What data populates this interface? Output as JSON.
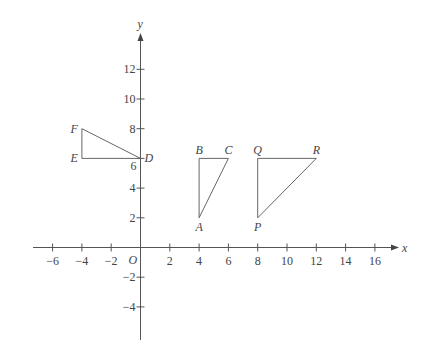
{
  "diagram": {
    "title": "",
    "axes": {
      "x_label": "x",
      "y_label": "y",
      "origin_label": "O",
      "x_range": [
        -7,
        17
      ],
      "y_range": [
        -6.5,
        14
      ],
      "x_ticks": [
        -6,
        -4,
        -2,
        2,
        4,
        6,
        8,
        10,
        12,
        14,
        16
      ],
      "y_ticks": [
        -4,
        -2,
        2,
        4,
        6,
        8,
        10,
        12
      ]
    },
    "shapes": [
      {
        "name": "triangle-DEF",
        "vertices": [
          {
            "label": "D",
            "x": 0,
            "y": 6,
            "label_pos": "right"
          },
          {
            "label": "E",
            "x": -4,
            "y": 6,
            "label_pos": "left"
          },
          {
            "label": "F",
            "x": -4,
            "y": 8,
            "label_pos": "left"
          }
        ]
      },
      {
        "name": "triangle-ABC",
        "vertices": [
          {
            "label": "A",
            "x": 4,
            "y": 2,
            "label_pos": "below"
          },
          {
            "label": "B",
            "x": 4,
            "y": 6,
            "label_pos": "above"
          },
          {
            "label": "C",
            "x": 6,
            "y": 6,
            "label_pos": "above"
          }
        ]
      },
      {
        "name": "triangle-PQR",
        "vertices": [
          {
            "label": "P",
            "x": 8,
            "y": 2,
            "label_pos": "below"
          },
          {
            "label": "Q",
            "x": 8,
            "y": 6,
            "label_pos": "above"
          },
          {
            "label": "R",
            "x": 12,
            "y": 6,
            "label_pos": "above"
          }
        ]
      }
    ]
  }
}
